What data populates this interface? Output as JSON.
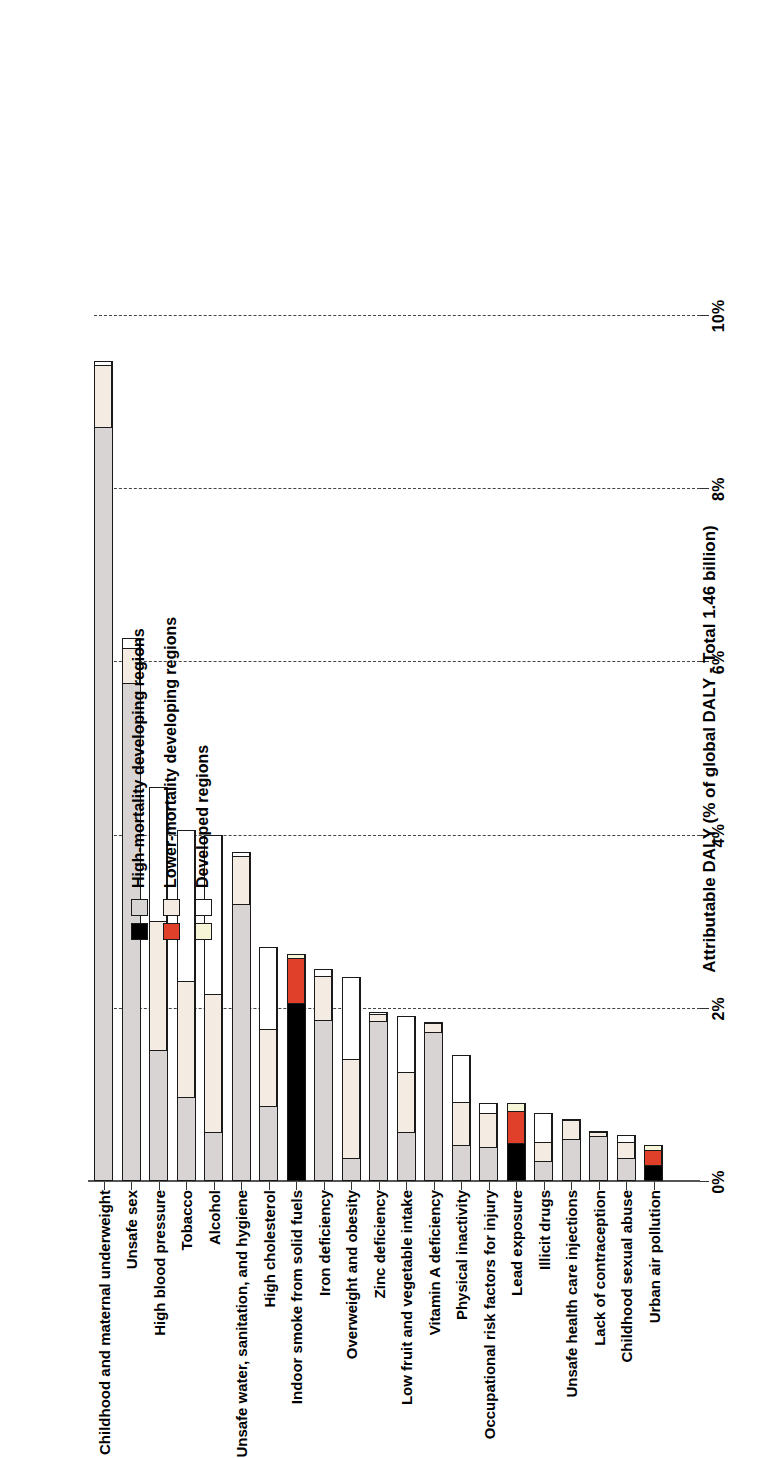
{
  "figure": {
    "axis_title": "Attributable DALY (% of global DALY - Total 1.46 billion)"
  },
  "legend": {
    "position": "inside-upper-right",
    "entries": [
      {
        "label": "High-mortality developing regions",
        "swatch_a": "#d9d4d4",
        "swatch_b": "#000000"
      },
      {
        "label": "Lower-mortality developing regions",
        "swatch_a": "#f4ece3",
        "swatch_b": "#e0402a"
      },
      {
        "label": "Developed regions",
        "swatch_a": "#ffffff",
        "swatch_b": "#f7f5d8"
      }
    ]
  },
  "colors": {
    "high_mortality": "#d9d4d4",
    "lower_mortality": "#f4ece3",
    "developed": "#ffffff",
    "high_mortality_alt": "#000000",
    "lower_mortality_alt": "#e0402a",
    "developed_alt": "#f7f5d8",
    "gridline": "#444444",
    "axis": "#555555"
  },
  "chart_data": {
    "type": "bar",
    "subtype": "stacked-bar-horizontal",
    "title": "",
    "xlabel": "",
    "ylabel": "Attributable DALY (% of global DALY - Total 1.46 billion)",
    "ylim": [
      0,
      10
    ],
    "yticks": [
      0,
      2,
      4,
      6,
      8,
      10
    ],
    "ytick_labels": [
      "0%",
      "2%",
      "4%",
      "6%",
      "8%",
      "10%"
    ],
    "grid": true,
    "legend_position": "inside-upper-right",
    "series": [
      {
        "name": "High-mortality developing regions",
        "color_key": "high_mortality"
      },
      {
        "name": "Lower-mortality developing regions",
        "color_key": "lower_mortality"
      },
      {
        "name": "Developed regions",
        "color_key": "developed"
      }
    ],
    "categories": [
      "Childhood and maternal underweight",
      "Unsafe sex",
      "High blood pressure",
      "Tobacco",
      "Alcohol",
      "Unsafe water, sanitation, and hygiene",
      "High cholesterol",
      "Indoor smoke from solid fuels",
      "Iron deficiency",
      "Overweight and obesity",
      "Zinc deficiency",
      "Low fruit and vegetable intake",
      "Vitamin A deficiency",
      "Physical inactivity",
      "Occupational risk factors for injury",
      "Lead exposure",
      "Illicit drugs",
      "Unsafe health care injections",
      "Lack of contraception",
      "Childhood sexual abuse",
      "Urban air pollution"
    ],
    "values": [
      {
        "category": "Childhood and maternal underweight",
        "high_mortality": 8.7,
        "lower_mortality": 0.72,
        "developed": 0.05,
        "total": 9.47,
        "alt_palette": false
      },
      {
        "category": "Unsafe sex",
        "high_mortality": 5.75,
        "lower_mortality": 0.4,
        "developed": 0.12,
        "total": 6.27,
        "alt_palette": false
      },
      {
        "category": "High blood pressure",
        "high_mortality": 1.5,
        "lower_mortality": 1.5,
        "developed": 1.55,
        "total": 4.55,
        "alt_palette": false
      },
      {
        "category": "Tobacco",
        "high_mortality": 0.95,
        "lower_mortality": 1.35,
        "developed": 1.75,
        "total": 4.05,
        "alt_palette": false
      },
      {
        "category": "Alcohol",
        "high_mortality": 0.55,
        "lower_mortality": 1.6,
        "developed": 1.85,
        "total": 4.0,
        "alt_palette": false
      },
      {
        "category": "Unsafe water, sanitation, and hygiene",
        "high_mortality": 3.2,
        "lower_mortality": 0.55,
        "developed": 0.05,
        "total": 3.8,
        "alt_palette": false
      },
      {
        "category": "High cholesterol",
        "high_mortality": 0.85,
        "lower_mortality": 0.9,
        "developed": 0.95,
        "total": 2.7,
        "alt_palette": false
      },
      {
        "category": "Indoor smoke from solid fuels",
        "high_mortality": 2.05,
        "lower_mortality": 0.53,
        "developed": 0.04,
        "total": 2.62,
        "alt_palette": true
      },
      {
        "category": "Iron deficiency",
        "high_mortality": 1.85,
        "lower_mortality": 0.52,
        "developed": 0.08,
        "total": 2.45,
        "alt_palette": false
      },
      {
        "category": "Overweight and obesity",
        "high_mortality": 0.25,
        "lower_mortality": 1.15,
        "developed": 0.95,
        "total": 2.35,
        "alt_palette": false
      },
      {
        "category": "Zinc deficiency",
        "high_mortality": 1.85,
        "lower_mortality": 0.08,
        "developed": 0.02,
        "total": 1.95,
        "alt_palette": false
      },
      {
        "category": "Low fruit and vegetable intake",
        "high_mortality": 0.55,
        "lower_mortality": 0.7,
        "developed": 0.65,
        "total": 1.9,
        "alt_palette": false
      },
      {
        "category": "Vitamin A deficiency",
        "high_mortality": 1.72,
        "lower_mortality": 0.1,
        "developed": 0.02,
        "total": 1.84,
        "alt_palette": false
      },
      {
        "category": "Physical inactivity",
        "high_mortality": 0.4,
        "lower_mortality": 0.5,
        "developed": 0.55,
        "total": 1.45,
        "alt_palette": false
      },
      {
        "category": "Occupational risk factors for injury",
        "high_mortality": 0.38,
        "lower_mortality": 0.4,
        "developed": 0.12,
        "total": 0.9,
        "alt_palette": false
      },
      {
        "category": "Lead exposure",
        "high_mortality": 0.43,
        "lower_mortality": 0.38,
        "developed": 0.09,
        "total": 0.9,
        "alt_palette": true
      },
      {
        "category": "Illicit drugs",
        "high_mortality": 0.22,
        "lower_mortality": 0.22,
        "developed": 0.34,
        "total": 0.78,
        "alt_palette": false
      },
      {
        "category": "Unsafe health care injections",
        "high_mortality": 0.48,
        "lower_mortality": 0.22,
        "developed": 0.02,
        "total": 0.72,
        "alt_palette": false
      },
      {
        "category": "Lack of contraception",
        "high_mortality": 0.52,
        "lower_mortality": 0.05,
        "developed": 0.01,
        "total": 0.58,
        "alt_palette": false
      },
      {
        "category": "Childhood sexual abuse",
        "high_mortality": 0.25,
        "lower_mortality": 0.2,
        "developed": 0.08,
        "total": 0.53,
        "alt_palette": false
      },
      {
        "category": "Urban air pollution",
        "high_mortality": 0.17,
        "lower_mortality": 0.18,
        "developed": 0.06,
        "total": 0.41,
        "alt_palette": true
      }
    ]
  }
}
